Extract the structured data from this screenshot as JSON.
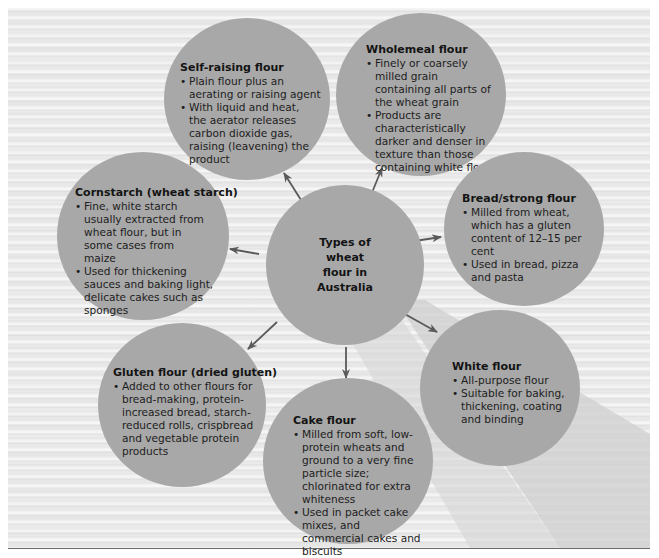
{
  "diagram": {
    "center": {
      "label": "Types of wheat flour in Australia",
      "lines": [
        "Types of",
        "wheat",
        "flour in",
        "Australia"
      ]
    },
    "nodes": [
      {
        "id": "self-raising",
        "title": "Self-raising flour",
        "bullets": [
          "Plain flour plus an aerating or raising agent",
          "With liquid and heat, the aerator releases carbon dioxide gas, raising (leavening) the product"
        ]
      },
      {
        "id": "wholemeal",
        "title": "Wholemeal flour",
        "bullets": [
          "Finely or coarsely milled grain containing all parts of the wheat grain",
          "Products are characteristically darker and denser in texture than those containing white flour"
        ]
      },
      {
        "id": "cornstarch",
        "title": "Cornstarch (wheat starch)",
        "bullets": [
          "Fine, white starch usually extracted from wheat flour, but in some cases from maize",
          "Used for thickening sauces and baking light, delicate cakes such as sponges"
        ]
      },
      {
        "id": "bread-strong",
        "title": "Bread/strong flour",
        "bullets": [
          "Milled from wheat, which has a gluten content of 12–15 per cent",
          "Used in bread, pizza and pasta"
        ]
      },
      {
        "id": "gluten",
        "title": "Gluten flour (dried gluten)",
        "bullets": [
          "Added to other flours for bread-making, protein-increased bread, starch-reduced rolls, crispbread and vegetable protein products"
        ]
      },
      {
        "id": "cake",
        "title": "Cake flour",
        "bullets": [
          "Milled from soft, low-protein wheats and ground to a very fine particle size; chlorinated for extra whiteness",
          "Used in packet cake mixes, and commercial cakes and biscuits"
        ]
      },
      {
        "id": "white",
        "title": "White flour",
        "bullets": [
          "All-purpose flour",
          "Suitable for baking, thickening, coating and binding"
        ]
      }
    ]
  },
  "colors": {
    "circle_fill": "#a8a8a8",
    "arrow": "#5a5a5a",
    "background": "#ececec",
    "text": "#1d1d1d"
  }
}
